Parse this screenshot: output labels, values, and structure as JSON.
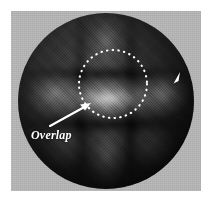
{
  "figure": {
    "domain": "Natural-Image",
    "caption_label": "Overlap",
    "background_color": "#b2b2b2",
    "border_color": "#ffffff",
    "annotation_color": "#ffffff",
    "specimen_color_light": "#4a4a4a",
    "specimen_color_dark": "#060606"
  },
  "annotations": {
    "overlap_label": "Overlap",
    "region_marker": {
      "name": "dotted-circle",
      "center_x": 113,
      "center_y": 84,
      "radius": 34,
      "style": "dotted",
      "color": "#ffffff"
    },
    "pointer_arrow": {
      "name": "overlap-arrow",
      "from_x": 50,
      "from_y": 126,
      "to_x": 90,
      "to_y": 104,
      "color": "#ffffff"
    },
    "edge_marker": {
      "name": "right-edge-arrowhead",
      "x": 177,
      "y": 79,
      "color": "#ffffff"
    }
  }
}
